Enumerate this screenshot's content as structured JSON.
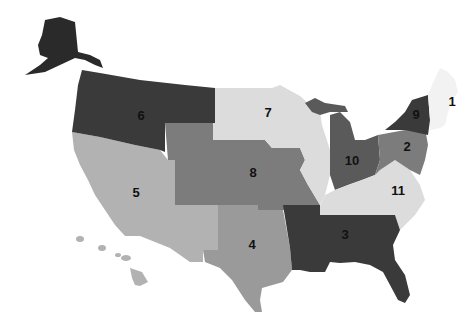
{
  "map": {
    "title": "",
    "type": "choropleth-regions",
    "colors": {
      "darkest": "#3a3a3a",
      "dark": "#5a5a5a",
      "medium": "#7c7c7c",
      "medium_light": "#9a9a9a",
      "light": "#b2b2b2",
      "lightest": "#dcdcdc",
      "white": "#f6f6f6"
    },
    "regions": [
      {
        "id": "1",
        "label": "1",
        "name": "New England",
        "shade": "white"
      },
      {
        "id": "2",
        "label": "2",
        "name": "Mid-Atlantic",
        "shade": "medium"
      },
      {
        "id": "3",
        "label": "3",
        "name": "Deep South",
        "shade": "darkest"
      },
      {
        "id": "4",
        "label": "4",
        "name": "South Central",
        "shade": "medium_light"
      },
      {
        "id": "5",
        "label": "5",
        "name": "Southwest / West",
        "shade": "light"
      },
      {
        "id": "6",
        "label": "6",
        "name": "Northwest",
        "shade": "darkest"
      },
      {
        "id": "7",
        "label": "7",
        "name": "Upper Midwest",
        "shade": "lightest"
      },
      {
        "id": "8",
        "label": "8",
        "name": "Central Plains",
        "shade": "medium"
      },
      {
        "id": "9",
        "label": "9",
        "name": "New York",
        "shade": "darkest"
      },
      {
        "id": "10",
        "label": "10",
        "name": "Great Lakes East",
        "shade": "dark"
      },
      {
        "id": "11",
        "label": "11",
        "name": "Upper South",
        "shade": "lightest"
      }
    ]
  }
}
